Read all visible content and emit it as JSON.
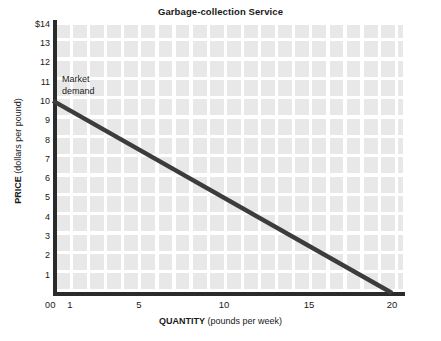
{
  "chart_data": {
    "type": "line",
    "title": "Garbage-collection Service",
    "xlabel_bold": "QUANTITY",
    "xlabel_rest": " (pounds per week)",
    "ylabel_bold": "PRICE",
    "ylabel_rest": " (dollars per pound)",
    "xlim": [
      0,
      20.5
    ],
    "ylim": [
      0,
      14
    ],
    "grid": true,
    "legend": "none",
    "x_ticks": [
      "0",
      "1",
      "5",
      "10",
      "15",
      "20"
    ],
    "x_tick_values": [
      0,
      1,
      5,
      10,
      15,
      20
    ],
    "y_ticks": [
      "$14",
      "13",
      "12",
      "11",
      "10",
      "9",
      "8",
      "7",
      "6",
      "5",
      "4",
      "3",
      "2",
      "1",
      "0"
    ],
    "y_tick_values": [
      14,
      13,
      12,
      11,
      10,
      9,
      8,
      7,
      6,
      5,
      4,
      3,
      2,
      1,
      0
    ],
    "series": [
      {
        "name": "Market demand",
        "color": "#3c3c3c",
        "x": [
          0,
          20
        ],
        "y": [
          10,
          0
        ],
        "points": [
          {
            "quantity": 0,
            "price": 10
          },
          {
            "quantity": 5,
            "price": 7.5
          },
          {
            "quantity": 10,
            "price": 5
          },
          {
            "quantity": 15,
            "price": 2.5
          },
          {
            "quantity": 20,
            "price": 0
          }
        ]
      }
    ],
    "annotations": [
      {
        "text": "Market\ndemand",
        "x": 0.5,
        "y": 11.3
      }
    ]
  },
  "colors": {
    "plot_background": "#e8e8e8",
    "gridline": "#ffffff",
    "axis": "#2b2b2b",
    "series": "#3c3c3c",
    "text": "#1a1a1a",
    "page_background": "#ffffff"
  }
}
